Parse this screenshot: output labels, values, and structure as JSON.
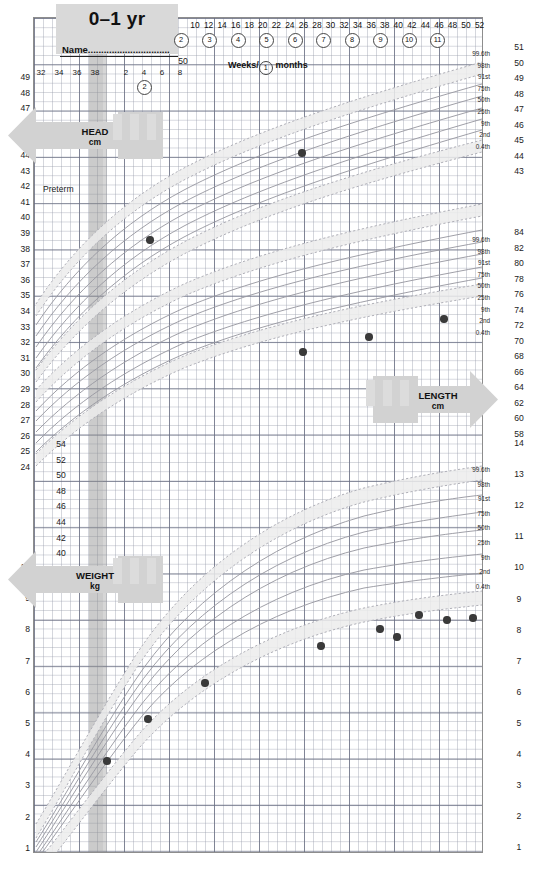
{
  "header": {
    "title": "0–1 yr",
    "name_label": "Name...............................",
    "preterm_label": "Preterm",
    "weeks_months_prefix": "Weeks/",
    "weeks_months_circle": "1",
    "weeks_months_suffix": "months"
  },
  "banners": {
    "head": {
      "title": "HEAD",
      "unit": "cm"
    },
    "length": {
      "title": "LENGTH",
      "unit": "cm"
    },
    "weight": {
      "title": "WEIGHT",
      "unit": "kg"
    }
  },
  "axes": {
    "gestation_weeks": [
      "32",
      "34",
      "36",
      "38"
    ],
    "early_weeks": [
      "2",
      "4",
      "6",
      "8"
    ],
    "top_weeks": [
      "10",
      "12",
      "14",
      "16",
      "18",
      "20",
      "22",
      "24",
      "26",
      "28",
      "30",
      "32",
      "34",
      "36",
      "38",
      "40",
      "42",
      "44",
      "46",
      "48",
      "50",
      "52"
    ],
    "month_markers": [
      "2",
      "3",
      "4",
      "5",
      "6",
      "7",
      "8",
      "9",
      "10",
      "11"
    ],
    "head_left_cm": [
      "49",
      "48",
      "47",
      "46",
      "45",
      "44",
      "43",
      "42",
      "41",
      "40",
      "39",
      "38",
      "37",
      "36",
      "35",
      "34",
      "33",
      "32",
      "31",
      "30",
      "29",
      "28",
      "27",
      "26",
      "25",
      "24"
    ],
    "head_right_cm": [
      "51",
      "50",
      "49",
      "48",
      "47",
      "46",
      "45",
      "44",
      "43"
    ],
    "length_inner_cm": [
      "54",
      "52",
      "50",
      "48",
      "46",
      "44",
      "42",
      "40"
    ],
    "length_right_cm": [
      "84",
      "82",
      "80",
      "78",
      "76",
      "74",
      "72",
      "70",
      "68",
      "66",
      "64",
      "62",
      "60",
      "58"
    ],
    "weight_left_kg": [
      "10",
      "9",
      "8",
      "7",
      "6",
      "5",
      "4",
      "3",
      "2",
      "1"
    ],
    "weight_right_kg": [
      "14",
      "13",
      "12",
      "11",
      "10",
      "9",
      "8",
      "7",
      "6",
      "5",
      "4",
      "3",
      "2",
      "1"
    ],
    "length_top_marker": "50"
  },
  "centiles": {
    "labels": [
      "99.6th",
      "98th",
      "91st",
      "75th",
      "50th",
      "25th",
      "9th",
      "2nd",
      "0.4th"
    ],
    "values": [
      99.6,
      98,
      91,
      75,
      50,
      25,
      9,
      2,
      0.4
    ]
  },
  "colors": {
    "grid_fine": "#969baa",
    "grid_bold": "#696e82",
    "centile_line": "#8a8a93",
    "band_shade": "#e8e8e8",
    "dot": "#3a3a3a",
    "header_fill": "#d9d9d9",
    "banner_fill": "#d2d2d2",
    "term_band": "#8c8c8c",
    "frame": "#8d8d8d"
  },
  "chart_data": [
    {
      "type": "line",
      "title": "Head circumference",
      "subtitle": "HEAD cm",
      "xlabel": "Weeks / months",
      "ylabel": "Head circumference (cm)",
      "xlim": [
        24,
        52
      ],
      "ylim": [
        24,
        49
      ],
      "grid": true,
      "legend": "right-edge centile labels",
      "centiles": [
        "0.4th",
        "2nd",
        "9th",
        "25th",
        "50th",
        "75th",
        "91st",
        "98th",
        "99.6th"
      ],
      "measurements": {
        "x_weeks": [
          10,
          24
        ],
        "y_cm": [
          38.1,
          44.2
        ],
        "x_labels": [
          "10 weeks",
          "24 weeks"
        ]
      }
    },
    {
      "type": "line",
      "title": "Length",
      "subtitle": "LENGTH cm",
      "xlabel": "Weeks / months",
      "ylabel": "Length (cm)",
      "xlim": [
        24,
        52
      ],
      "ylim": [
        56,
        86
      ],
      "grid": true,
      "centiles": [
        "0.4th",
        "2nd",
        "9th",
        "25th",
        "50th",
        "75th",
        "91st",
        "98th",
        "99.6th"
      ],
      "measurements": {
        "x_weeks": [
          26,
          34,
          44
        ],
        "y_cm": [
          66.4,
          70.3,
          72.3
        ],
        "x_labels": [
          "26 weeks",
          "34 weeks",
          "44 weeks"
        ]
      }
    },
    {
      "type": "line",
      "title": "Weight",
      "subtitle": "WEIGHT kg",
      "xlabel": "Weeks / months",
      "ylabel": "Weight (kg)",
      "xlim": [
        24,
        52
      ],
      "ylim": [
        1,
        14
      ],
      "grid": true,
      "centiles": [
        "0.4th",
        "2nd",
        "9th",
        "25th",
        "50th",
        "75th",
        "91st",
        "98th",
        "99.6th"
      ],
      "measurements": {
        "x_weeks": [
          38,
          2,
          10,
          18,
          26,
          34,
          38,
          42,
          46,
          50
        ],
        "y_kg": [
          3.55,
          4.85,
          6.1,
          7.4,
          7.95,
          7.7,
          8.25,
          8.2,
          8.3,
          8.3
        ],
        "x_labels": [
          "38 weeks gest",
          "2 weeks",
          "10 weeks",
          "18 weeks",
          "26 weeks",
          "34 weeks",
          "38 weeks",
          "42 weeks",
          "46 weeks",
          "50 weeks"
        ]
      }
    }
  ]
}
